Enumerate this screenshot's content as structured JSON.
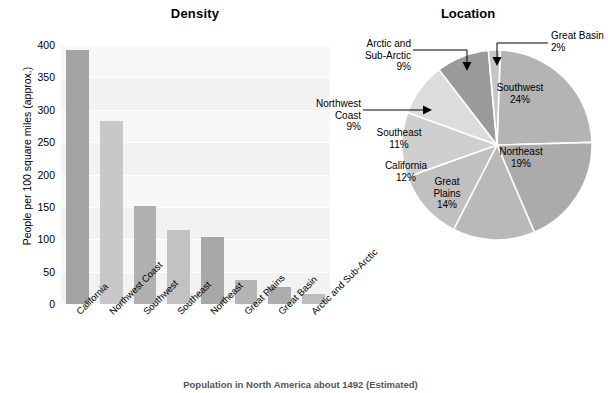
{
  "chart_data": [
    {
      "type": "bar",
      "title": "Density",
      "xlabel": "",
      "ylabel": "People per 100 square miles (approx.)",
      "ylim": [
        0,
        400
      ],
      "yticks": [
        0,
        50,
        100,
        150,
        200,
        250,
        300,
        350,
        400
      ],
      "grid": true,
      "legend": "none",
      "categories": [
        "California",
        "Northwest Coast",
        "Southwest",
        "Southeast",
        "Northeast",
        "Great Plains",
        "Great Basin",
        "Arctic and Sub-Arctic"
      ],
      "values": [
        393,
        283,
        152,
        114,
        104,
        37,
        27,
        16
      ],
      "colors": [
        "#a3a3a3",
        "#c8c8c8",
        "#b0b0b0",
        "#c2c2c2",
        "#a8a8a8",
        "#b5b5b5",
        "#adadad",
        "#bdbdbd"
      ],
      "plot_background": "#f4f4f4"
    },
    {
      "type": "pie",
      "title": "Location",
      "labels": [
        "Southwest",
        "Northeast",
        "Great Plains",
        "California",
        "Southeast",
        "Northwest Coast",
        "Arctic and Sub-Arctic",
        "Great Basin"
      ],
      "values": [
        24,
        19,
        14,
        12,
        11,
        9,
        9,
        2
      ],
      "value_suffix": "%",
      "colors": [
        "#b4b4b4",
        "#ababab",
        "#b9b9b9",
        "#c0c0c0",
        "#cfcfcf",
        "#dcdcdc",
        "#9a9a9a",
        "#c6c6c6"
      ],
      "legend": "callouts",
      "inside_labels": [
        "Southwest",
        "Northeast",
        "Great Plains",
        "California",
        "Southeast"
      ],
      "callout_labels": [
        "Northwest Coast",
        "Arctic and Sub-Arctic",
        "Great Basin"
      ]
    }
  ],
  "bar": {
    "title": "Density",
    "ylabel": "People per 100 square miles (approx.)",
    "yticks": [
      "400",
      "350",
      "300",
      "250",
      "200",
      "150",
      "100",
      "50",
      "0"
    ],
    "categories": [
      "California",
      "Northwest Coast",
      "Southwest",
      "Southeast",
      "Northeast",
      "Great Plains",
      "Great Basin",
      "Arctic and Sub-Arctic"
    ]
  },
  "pie": {
    "title": "Location",
    "slices": [
      {
        "name": "Southwest",
        "line1": "Southwest",
        "line2": "24%"
      },
      {
        "name": "Northeast",
        "line1": "Northeast",
        "line2": "19%"
      },
      {
        "name": "Great Plains",
        "line1": "Great",
        "line2": "Plains",
        "line3": "14%"
      },
      {
        "name": "California",
        "line1": "California",
        "line2": "12%"
      },
      {
        "name": "Southeast",
        "line1": "Southeast",
        "line2": "11%"
      }
    ],
    "callouts": {
      "northwest_coast": {
        "line1": "Northwest",
        "line2": "Coast",
        "line3": "9%"
      },
      "arctic": {
        "line1": "Arctic and",
        "line2": "Sub-Arctic",
        "line3": "9%"
      },
      "great_basin": {
        "line1": "Great Basin",
        "line2": "2%"
      }
    }
  },
  "caption": "Population in North America about 1492 (Estimated)"
}
